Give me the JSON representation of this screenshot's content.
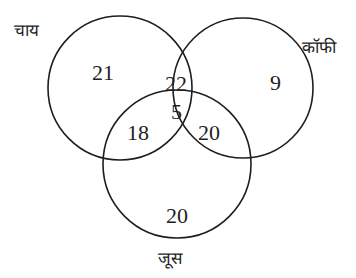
{
  "diagram": {
    "type": "venn",
    "sets": [
      {
        "id": "tea",
        "label": "चाय",
        "only": "21"
      },
      {
        "id": "coffee",
        "label": "कॉफी",
        "only": "9"
      },
      {
        "id": "juice",
        "label": "जूस",
        "only": "20"
      }
    ],
    "regions": {
      "tea_only": "21",
      "coffee_only": "9",
      "juice_only": "20",
      "tea_coffee_only": "22",
      "tea_juice_only": "18",
      "coffee_juice_only": "20",
      "tea_coffee_juice": "5"
    },
    "colors": {
      "stroke": "#1e1e1e",
      "text": "#1e1e1e",
      "background": "#ffffff"
    }
  }
}
